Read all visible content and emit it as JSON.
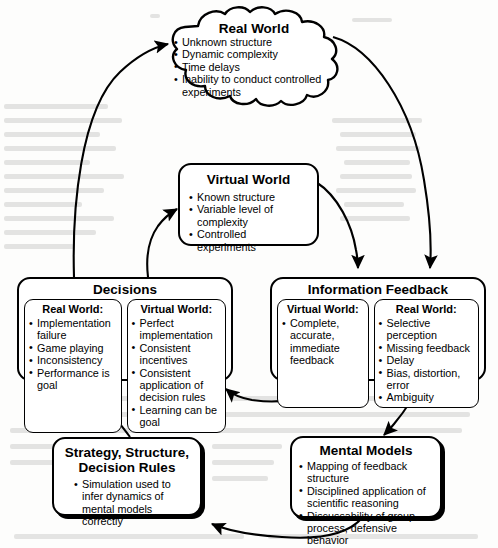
{
  "diagram": {
    "nodes": {
      "real_world": {
        "title": "Real World",
        "shape": "cloud",
        "bullets": [
          "Unknown structure",
          "Dynamic complexity",
          "Time delays",
          "Inability to conduct controlled experiments"
        ]
      },
      "virtual_world": {
        "title": "Virtual World",
        "shape": "rounded-rect",
        "bullets": [
          "Known structure",
          "Variable level of complexity",
          "Controlled experiments"
        ]
      },
      "decisions": {
        "title": "Decisions",
        "shape": "rounded-rect",
        "sub_boxes": [
          {
            "heading": "Real World:",
            "bullets": [
              "Implementation failure",
              "Game playing",
              "Inconsistency",
              "Performance is goal"
            ]
          },
          {
            "heading": "Virtual World:",
            "bullets": [
              "Perfect implementation",
              "Consistent incentives",
              "Consistent application of decision rules",
              "Learning can be goal"
            ]
          }
        ]
      },
      "information_feedback": {
        "title": "Information Feedback",
        "shape": "rounded-rect",
        "sub_boxes": [
          {
            "heading": "Virtual World:",
            "bullets": [
              "Complete, accurate, immediate feedback"
            ]
          },
          {
            "heading": "Real World:",
            "bullets": [
              "Selective perception",
              "Missing feedback",
              "Delay",
              "Bias, distortion, error",
              "Ambiguity"
            ]
          }
        ]
      },
      "strategy": {
        "title_line1": "Strategy, Structure,",
        "title_line2": "Decision Rules",
        "shape": "rounded-rect-shadow",
        "bullets": [
          "Simulation used to infer dynamics of  mental models correctly"
        ]
      },
      "mental_models": {
        "title": "Mental Models",
        "shape": "rounded-rect-shadow",
        "bullets": [
          "Mapping of feedback structure",
          "Disciplined application of scientific reasoning",
          "Discussability of group process, defensive behavior"
        ]
      }
    },
    "edges": [
      {
        "id": "decisions-to-real-world",
        "from": "decisions",
        "to": "real_world",
        "style": "curved-arrow"
      },
      {
        "id": "decisions-to-virtual-world",
        "from": "decisions",
        "to": "virtual_world",
        "style": "curved-arrow"
      },
      {
        "id": "real-world-to-information-feedback",
        "from": "real_world",
        "to": "information_feedback",
        "style": "curved-arrow"
      },
      {
        "id": "virtual-world-to-information-feedback",
        "from": "virtual_world",
        "to": "information_feedback",
        "style": "curved-arrow"
      },
      {
        "id": "information-feedback-to-decisions",
        "from": "information_feedback",
        "to": "decisions",
        "style": "curved-arrow"
      },
      {
        "id": "information-feedback-to-mental-models",
        "from": "information_feedback",
        "to": "mental_models",
        "style": "curved-arrow"
      },
      {
        "id": "mental-models-to-strategy",
        "from": "mental_models",
        "to": "strategy",
        "style": "curved-arrow"
      },
      {
        "id": "strategy-to-decisions",
        "from": "strategy",
        "to": "decisions",
        "style": "curved-arrow"
      }
    ],
    "colors": {
      "stroke": "#000000",
      "background": "#fdfdfc",
      "node_fill": "#ffffff"
    }
  }
}
